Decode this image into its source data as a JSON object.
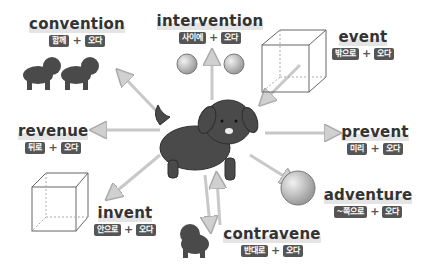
{
  "diagram": {
    "center": "dog",
    "words": [
      {
        "word": "convention",
        "prefix": "함께",
        "plus": "+",
        "root": "오다"
      },
      {
        "word": "intervention",
        "prefix": "사이에",
        "plus": "+",
        "root": "오다"
      },
      {
        "word": "event",
        "prefix": "밖으로",
        "plus": "+",
        "root": "오다"
      },
      {
        "word": "revenue",
        "prefix": "뒤로",
        "plus": "+",
        "root": "오다"
      },
      {
        "word": "prevent",
        "prefix": "미리",
        "plus": "+",
        "root": "오다"
      },
      {
        "word": "adventure",
        "prefix": "~쪽으로",
        "plus": "+",
        "root": "오다"
      },
      {
        "word": "invent",
        "prefix": "안으로",
        "plus": "+",
        "root": "오다"
      },
      {
        "word": "contravene",
        "prefix": "반대로",
        "plus": "+",
        "root": "오다"
      }
    ],
    "colors": {
      "chip": "#555555",
      "arrow": "#c8c8c8",
      "dog": "#4a4a4a"
    }
  }
}
